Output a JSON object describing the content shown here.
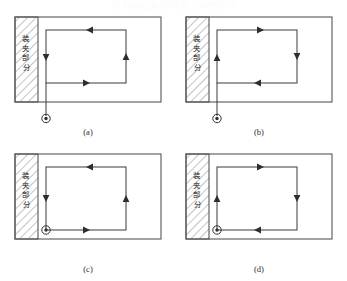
{
  "figure": {
    "top_caption": "图 机床加工路径示意图  刀具进给方向",
    "clamp_label": "装夹部分",
    "clamp_label_chars": [
      "装",
      "夹",
      "部",
      "分"
    ],
    "colors": {
      "line": "#3a3a3a",
      "outline": "#555555",
      "hatch": "#6a6a6a",
      "text": "#1a1a1a",
      "background": "#ffffff"
    },
    "entry_symbol_name": "tool-entry-point",
    "panels": [
      {
        "id": "a",
        "label": "(a)",
        "direction": "counter-clockwise",
        "entry_position": "below-workpiece-lead-in",
        "arrows": {
          "top": "left",
          "right": "up",
          "bottom": "right",
          "left": "down"
        },
        "has_lead_in_line": true
      },
      {
        "id": "b",
        "label": "(b)",
        "direction": "clockwise",
        "entry_position": "below-workpiece-lead-in",
        "arrows": {
          "top": "right",
          "right": "down",
          "bottom": "left",
          "left": "up"
        },
        "has_lead_in_line": true
      },
      {
        "id": "c",
        "label": "(c)",
        "direction": "counter-clockwise",
        "entry_position": "bottom-left-corner",
        "arrows": {
          "top": "left",
          "right": "up",
          "bottom": "right",
          "left": "down"
        },
        "has_lead_in_line": false
      },
      {
        "id": "d",
        "label": "(d)",
        "direction": "clockwise",
        "entry_position": "bottom-left-corner",
        "arrows": {
          "top": "right",
          "right": "down",
          "bottom": "left",
          "left": "up"
        },
        "has_lead_in_line": false
      }
    ]
  }
}
